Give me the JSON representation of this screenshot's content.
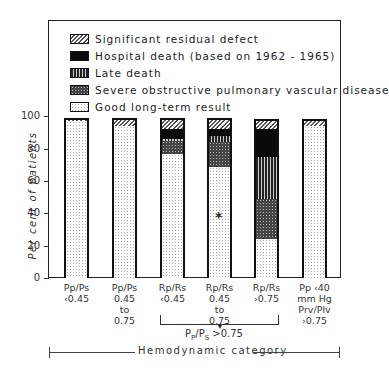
{
  "chart_data": {
    "type": "bar",
    "stacked": true,
    "title": "",
    "xlabel": "Hemodynamic category",
    "ylabel": "Per cent of patients",
    "ylim": [
      0,
      100
    ],
    "yticks": [
      0,
      20,
      40,
      60,
      80,
      100
    ],
    "grid": false,
    "legend_position": "top, inside frame",
    "categories": [
      "Pp/Ps <0.45",
      "Pp/Ps 0.45 to 0.75",
      "Rp/Rs <0.45",
      "Rp/Rs 0.45 to 0.75",
      "Rp/Rs >0.75",
      "Pp <40 mm Hg, Prv/Plv >0.75"
    ],
    "series": [
      {
        "name": "Good long-term result",
        "values": [
          98,
          95,
          78,
          70,
          25,
          95
        ]
      },
      {
        "name": "Severe obstructive pulmonary vascular disease",
        "values": [
          0,
          0,
          8,
          15,
          25,
          0
        ]
      },
      {
        "name": "Late death",
        "values": [
          0,
          0,
          1,
          4,
          26,
          0
        ]
      },
      {
        "name": "Hospital death (based on 1962-1965)",
        "values": [
          0,
          0,
          6,
          4,
          17,
          0
        ]
      },
      {
        "name": "Significant residual defect",
        "values": [
          1,
          4,
          6,
          6,
          5,
          3
        ]
      }
    ],
    "annotations": [
      {
        "text": "*",
        "category": "Rp/Rs 0.45 to 0.75",
        "y": 38
      },
      {
        "text": "Pp/Ps >0.75",
        "type": "bracket",
        "spans": [
          "Rp/Rs <0.45",
          "Rp/Rs 0.45 to 0.75",
          "Rp/Rs >0.75"
        ]
      }
    ]
  },
  "legend": [
    {
      "label": "Significant residual defect",
      "pattern": "residual"
    },
    {
      "label": "Hospital death (based on 1962 - 1965)",
      "pattern": "hospital"
    },
    {
      "label": "Late death",
      "pattern": "late"
    },
    {
      "label": "Severe obstructive pulmonary vascular disease",
      "pattern": "sopvd"
    },
    {
      "label": "Good long-term result",
      "pattern": "good"
    }
  ],
  "axis": {
    "ylabel": "Per cent of patients",
    "yticks": [
      "0",
      "20",
      "40",
      "60",
      "80",
      "100"
    ],
    "category_label": "Hemodynamic category",
    "bracket_label": "Pp/Ps >0.75"
  },
  "xlabels": [
    [
      "Pp/Ps",
      "<0.45"
    ],
    [
      "Pp/Ps",
      "0.45",
      "to",
      "0.75"
    ],
    [
      "Rp/Rs",
      "<0.45"
    ],
    [
      "Rp/Rs",
      "0.45",
      "to",
      "0.75"
    ],
    [
      "Rp/Rs",
      ">0.75"
    ],
    [
      "Pp <40",
      "mm Hg",
      "Prv/Plv",
      ">0.75"
    ]
  ],
  "asterisk": "*"
}
